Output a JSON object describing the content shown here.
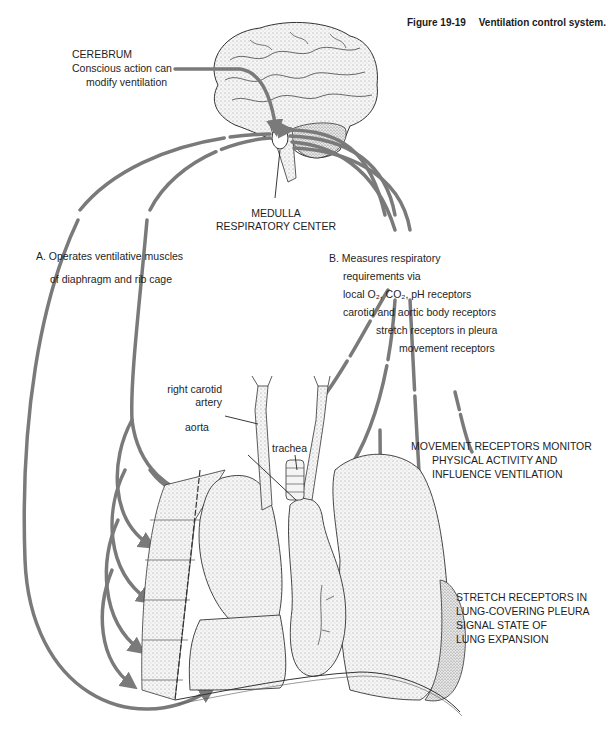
{
  "figure": {
    "number": "Figure 19-19",
    "title": "Ventilation control system."
  },
  "labels": {
    "cerebrum": {
      "heading": "CEREBRUM",
      "line1": "Conscious action can",
      "line2": "modify ventilation"
    },
    "medulla": {
      "line1": "MEDULLA",
      "line2": "RESPIRATORY CENTER"
    },
    "operates": {
      "line1": "A. Operates ventilative muscles",
      "line2": "of diaphragm and rib cage"
    },
    "measures": {
      "line1": "B. Measures respiratory",
      "line2": "requirements via",
      "line3": "local O₂, CO₂, pH receptors",
      "line4": "carotid and aortic body receptors",
      "line5": "stretch receptors in  pleura",
      "line6": "movement receptors"
    },
    "anatomy": {
      "carotid_line1": "right carotid",
      "carotid_line2": "artery",
      "aorta": "aorta",
      "trachea": "trachea"
    },
    "movement_receptors": {
      "line1": "MOVEMENT RECEPTORS MONITOR",
      "line2": "PHYSICAL ACTIVITY AND",
      "line3": "INFLUENCE VENTILATION"
    },
    "stretch_receptors": {
      "line1": "STRETCH RECEPTORS IN",
      "line2": "LUNG-COVERING PLEURA",
      "line3": "SIGNAL STATE OF",
      "line4": "LUNG EXPANSION"
    }
  },
  "colors": {
    "pathway": "#7a7a7a",
    "ink": "#333333",
    "stipple": "#cfcfcf"
  }
}
